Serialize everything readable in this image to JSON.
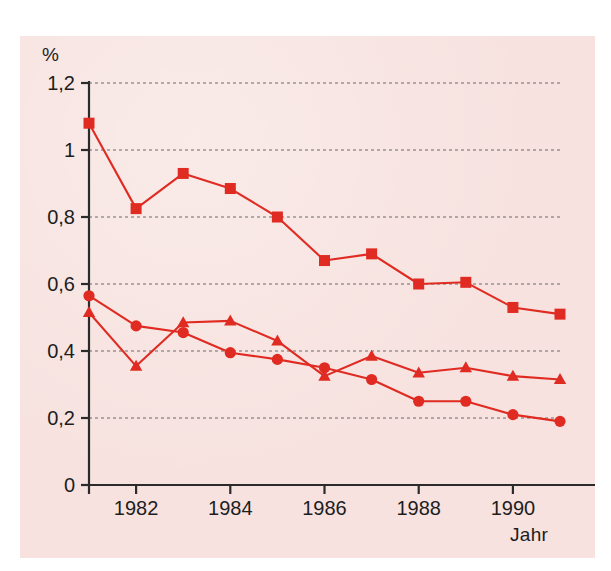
{
  "figure": {
    "unit_label": "%",
    "x_axis_title": "Jahr",
    "background_color": "#f7e2df",
    "series_color": "#e02b22",
    "axis_color": "#2b2b2b"
  },
  "chart_data": {
    "type": "line",
    "title": "",
    "xlabel": "Jahr",
    "ylabel": "%",
    "grid": true,
    "legend_position": "none",
    "xlim": [
      1981,
      1991
    ],
    "ylim": [
      0,
      1.2
    ],
    "x": [
      1981,
      1982,
      1983,
      1984,
      1985,
      1986,
      1987,
      1988,
      1989,
      1990,
      1991
    ],
    "xtick_labels": [
      "1982",
      "1984",
      "1986",
      "1988",
      "1990"
    ],
    "xticks": [
      1982,
      1984,
      1986,
      1988,
      1990
    ],
    "yticks": [
      0,
      0.2,
      0.4,
      0.6,
      0.8,
      1,
      1.2
    ],
    "ytick_labels": [
      "0",
      "0,2",
      "0,4",
      "0,6",
      "0,8",
      "1",
      "1,2"
    ],
    "series": [
      {
        "name": "series-squares",
        "marker": "square",
        "color": "#e02b22",
        "values": [
          1.08,
          0.825,
          0.93,
          0.885,
          0.8,
          0.67,
          0.69,
          0.6,
          0.605,
          0.53,
          0.51
        ]
      },
      {
        "name": "series-circles",
        "marker": "circle",
        "color": "#e02b22",
        "values": [
          0.565,
          0.475,
          0.455,
          0.395,
          0.375,
          0.35,
          0.315,
          0.25,
          0.25,
          0.21,
          0.19
        ]
      },
      {
        "name": "series-triangles",
        "marker": "triangle",
        "color": "#e02b22",
        "values": [
          0.515,
          0.355,
          0.485,
          0.49,
          0.43,
          0.325,
          0.385,
          0.335,
          0.35,
          0.325,
          0.315
        ]
      }
    ]
  }
}
